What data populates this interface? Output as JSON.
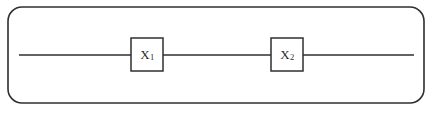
{
  "diagram": {
    "type": "quantum-circuit",
    "background_color": "#ffffff",
    "stroke_color": "#2f2f2f",
    "text_color": "#2b2b2b",
    "frame": {
      "shape": "rounded-rectangle",
      "x": 8,
      "y": 7,
      "width": 416,
      "height": 96,
      "corner_radius": 14,
      "stroke_width": 1.6
    },
    "wire": {
      "label": "qubit-wire",
      "y": 55,
      "x_start": 19,
      "x_end": 414,
      "stroke_width": 1.4,
      "segments": [
        {
          "x1": 19,
          "x2": 131
        },
        {
          "x1": 163,
          "x2": 271
        },
        {
          "x1": 303,
          "x2": 414
        }
      ]
    },
    "gates": [
      {
        "id": "gate-x1",
        "symbol": "X",
        "subscript": "1",
        "full_label": "X1",
        "x": 131,
        "y": 38,
        "width": 32,
        "height": 33,
        "stroke_width": 1.5
      },
      {
        "id": "gate-x2",
        "symbol": "X",
        "subscript": "2",
        "full_label": "X2",
        "x": 271,
        "y": 38,
        "width": 32,
        "height": 33,
        "stroke_width": 1.5
      }
    ]
  }
}
